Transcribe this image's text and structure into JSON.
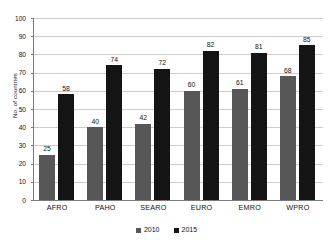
{
  "chart_data": {
    "type": "bar",
    "title": "",
    "xlabel": "",
    "ylabel": "No. of countries",
    "ylim": [
      0,
      100
    ],
    "ytick_step": 10,
    "yticks": [
      0,
      10,
      20,
      30,
      40,
      50,
      60,
      70,
      80,
      90,
      100
    ],
    "grid": true,
    "legend_position": "bottom-center",
    "categories": [
      "AFRO",
      "PAHO",
      "SEARO",
      "EURO",
      "EMRO",
      "WPRO"
    ],
    "series": [
      {
        "name": "2010",
        "color": "#575757",
        "values": [
          25,
          40,
          42,
          60,
          61,
          68
        ]
      },
      {
        "name": "2015",
        "color": "#141414",
        "values": [
          58,
          74,
          72,
          82,
          81,
          85
        ]
      }
    ],
    "data_labels": {
      "2010": [
        "25",
        "40",
        "42",
        "60",
        "61",
        "68"
      ],
      "2015": [
        "58",
        "74",
        "72",
        "82",
        "81",
        "85"
      ]
    },
    "axis_line_color": "#7a7a7a",
    "gridline_color": "#cccccc",
    "background_color": "#ffffff"
  }
}
